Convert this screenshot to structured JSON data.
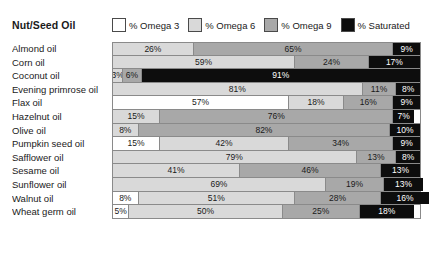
{
  "header": {
    "title": "Nut/Seed Oil"
  },
  "legend": {
    "items": [
      {
        "label": "% Omega 3",
        "key": "omega3",
        "swatch_class": "sw-o3",
        "color": "#ffffff"
      },
      {
        "label": "% Omega 6",
        "key": "omega6",
        "swatch_class": "sw-o6",
        "color": "#d9d9d9"
      },
      {
        "label": "% Omega 9",
        "key": "omega9",
        "swatch_class": "sw-o9",
        "color": "#a8a8a8"
      },
      {
        "label": "% Saturated",
        "key": "saturated",
        "swatch_class": "sw-sat",
        "color": "#0d0d0d"
      }
    ]
  },
  "chart_data": {
    "type": "bar",
    "title": "Nut/Seed Oil",
    "xlabel": "",
    "ylabel": "",
    "xlim": [
      0,
      100
    ],
    "grid": false,
    "stacked": true,
    "orientation": "horizontal",
    "legend_position": "top",
    "unit": "%",
    "categories": [
      "Almond oil",
      "Corn oil",
      "Coconut oil",
      "Evening primrose oil",
      "Flax oil",
      "Hazelnut oil",
      "Olive oil",
      "Pumpkin seed oil",
      "Safflower oil",
      "Sesame oil",
      "Sunflower oil",
      "Walnut oil",
      "Wheat germ oil"
    ],
    "series": [
      {
        "name": "% Omega 3",
        "color": "#ffffff",
        "values": [
          0,
          0,
          0,
          0,
          57,
          0,
          0,
          15,
          0,
          0,
          0,
          8,
          5
        ]
      },
      {
        "name": "% Omega 6",
        "color": "#d9d9d9",
        "values": [
          26,
          59,
          3,
          81,
          18,
          15,
          8,
          42,
          79,
          41,
          69,
          51,
          50
        ]
      },
      {
        "name": "% Omega 9",
        "color": "#a8a8a8",
        "values": [
          65,
          24,
          6,
          11,
          16,
          76,
          82,
          34,
          13,
          46,
          19,
          28,
          25
        ]
      },
      {
        "name": "% Saturated",
        "color": "#0d0d0d",
        "values": [
          9,
          17,
          91,
          8,
          9,
          7,
          10,
          9,
          8,
          13,
          13,
          16,
          18
        ]
      }
    ]
  },
  "rows": [
    {
      "label": "Almond oil",
      "segments": [
        {
          "class": "seg-o6",
          "value": 26,
          "text": "26%"
        },
        {
          "class": "seg-o9",
          "value": 65,
          "text": "65%"
        },
        {
          "class": "seg-sat",
          "value": 9,
          "text": "9%"
        }
      ]
    },
    {
      "label": "Corn oil",
      "segments": [
        {
          "class": "seg-o6",
          "value": 59,
          "text": "59%"
        },
        {
          "class": "seg-o9",
          "value": 24,
          "text": "24%"
        },
        {
          "class": "seg-sat",
          "value": 17,
          "text": "17%"
        }
      ]
    },
    {
      "label": "Coconut oil",
      "segments": [
        {
          "class": "seg-o6",
          "value": 3,
          "text": "3%"
        },
        {
          "class": "seg-o9",
          "value": 6,
          "text": "6%"
        },
        {
          "class": "seg-sat",
          "value": 91,
          "text": "91%"
        }
      ]
    },
    {
      "label": "Evening primrose oil",
      "segments": [
        {
          "class": "seg-o6",
          "value": 81,
          "text": "81%"
        },
        {
          "class": "seg-o9",
          "value": 11,
          "text": "11%"
        },
        {
          "class": "seg-sat",
          "value": 8,
          "text": "8%"
        }
      ]
    },
    {
      "label": "Flax oil",
      "segments": [
        {
          "class": "seg-o3",
          "value": 57,
          "text": "57%"
        },
        {
          "class": "seg-o6",
          "value": 18,
          "text": "18%"
        },
        {
          "class": "seg-o9",
          "value": 16,
          "text": "16%"
        },
        {
          "class": "seg-sat",
          "value": 9,
          "text": "9%"
        }
      ]
    },
    {
      "label": "Hazelnut oil",
      "segments": [
        {
          "class": "seg-o6",
          "value": 15,
          "text": "15%"
        },
        {
          "class": "seg-o9",
          "value": 76,
          "text": "76%"
        },
        {
          "class": "seg-sat",
          "value": 7,
          "text": "7%"
        }
      ]
    },
    {
      "label": "Olive oil",
      "segments": [
        {
          "class": "seg-o6",
          "value": 8,
          "text": "8%"
        },
        {
          "class": "seg-o9",
          "value": 82,
          "text": "82%"
        },
        {
          "class": "seg-sat",
          "value": 10,
          "text": "10%"
        }
      ]
    },
    {
      "label": "Pumpkin seed oil",
      "segments": [
        {
          "class": "seg-o3",
          "value": 15,
          "text": "15%"
        },
        {
          "class": "seg-o6",
          "value": 42,
          "text": "42%"
        },
        {
          "class": "seg-o9",
          "value": 34,
          "text": "34%"
        },
        {
          "class": "seg-sat",
          "value": 9,
          "text": "9%"
        }
      ]
    },
    {
      "label": "Safflower oil",
      "segments": [
        {
          "class": "seg-o6",
          "value": 79,
          "text": "79%"
        },
        {
          "class": "seg-o9",
          "value": 13,
          "text": "13%"
        },
        {
          "class": "seg-sat",
          "value": 8,
          "text": "8%"
        }
      ]
    },
    {
      "label": "Sesame oil",
      "segments": [
        {
          "class": "seg-o6",
          "value": 41,
          "text": "41%"
        },
        {
          "class": "seg-o9",
          "value": 46,
          "text": "46%"
        },
        {
          "class": "seg-sat",
          "value": 13,
          "text": "13%"
        }
      ]
    },
    {
      "label": "Sunflower oil",
      "segments": [
        {
          "class": "seg-o6",
          "value": 69,
          "text": "69%"
        },
        {
          "class": "seg-o9",
          "value": 19,
          "text": "19%"
        },
        {
          "class": "seg-sat",
          "value": 13,
          "text": "13%"
        }
      ]
    },
    {
      "label": "Walnut oil",
      "segments": [
        {
          "class": "seg-o3",
          "value": 8,
          "text": "8%"
        },
        {
          "class": "seg-o6",
          "value": 51,
          "text": "51%"
        },
        {
          "class": "seg-o9",
          "value": 28,
          "text": "28%"
        },
        {
          "class": "seg-sat",
          "value": 16,
          "text": "16%"
        }
      ]
    },
    {
      "label": "Wheat germ oil",
      "segments": [
        {
          "class": "seg-o3",
          "value": 5,
          "text": "5%"
        },
        {
          "class": "seg-o6",
          "value": 50,
          "text": "50%"
        },
        {
          "class": "seg-o9",
          "value": 25,
          "text": "25%"
        },
        {
          "class": "seg-sat",
          "value": 18,
          "text": "18%"
        }
      ]
    }
  ]
}
